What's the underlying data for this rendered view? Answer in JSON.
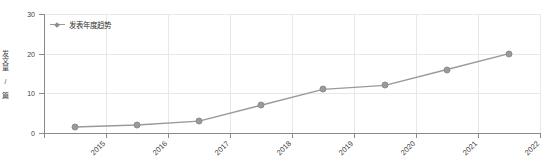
{
  "chart_data": {
    "type": "line",
    "title": "",
    "subtitle": "",
    "xlabel": "",
    "ylabel": "发文量 / 篇",
    "categories": [
      "2015",
      "2016",
      "2017",
      "2018",
      "2019",
      "2020",
      "2021",
      "2022"
    ],
    "series": [
      {
        "name": "发表年度趋势",
        "values": [
          1.5,
          2,
          3,
          7,
          11,
          12,
          16,
          20
        ],
        "color": "#9a9a9a",
        "marker": "circle"
      }
    ],
    "ylim": [
      0,
      30
    ],
    "yticks": [
      0,
      10,
      20,
      30
    ],
    "ytick_labels": [
      "0",
      "10",
      "20",
      "30"
    ],
    "grid": "both",
    "legend_position": "top-left",
    "legend_entries": [
      "发表年度趋势"
    ]
  },
  "axis": {
    "y_title": "发文量 / 篇"
  }
}
